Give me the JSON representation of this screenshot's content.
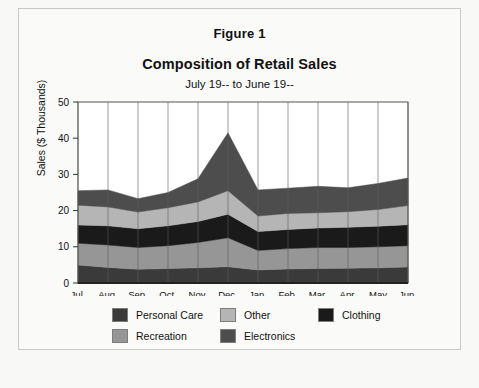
{
  "figure": {
    "label": "Figure 1",
    "title": "Composition of Retail Sales",
    "subtitle": "July 19-- to June 19--"
  },
  "chart_data": {
    "type": "area",
    "stacked": true,
    "title": "Composition of Retail Sales",
    "subtitle": "July 19-- to June 19--",
    "xlabel": "",
    "ylabel": "Sales ($ Thousands)",
    "ylim": [
      0,
      50
    ],
    "yticks": [
      0,
      10,
      20,
      30,
      40,
      50
    ],
    "grid": "vertical",
    "legend_position": "bottom",
    "categories": [
      "Jul.",
      "Aug.",
      "Sep.",
      "Oct.",
      "Nov.",
      "Dec.",
      "Jan.",
      "Feb.",
      "Mar.",
      "Apr.",
      "May",
      "Jun."
    ],
    "series": [
      {
        "name": "Personal Care",
        "color": "#3a3a3a",
        "values": [
          5.0,
          4.3,
          3.8,
          4.0,
          4.2,
          4.5,
          3.6,
          3.9,
          4.0,
          4.1,
          4.2,
          4.4
        ]
      },
      {
        "name": "Recreation",
        "color": "#969696",
        "values": [
          6.0,
          6.2,
          6.0,
          6.3,
          7.0,
          8.0,
          5.4,
          5.6,
          5.8,
          5.7,
          5.8,
          5.9
        ]
      },
      {
        "name": "Clothing",
        "color": "#1a1a1a",
        "values": [
          5.0,
          5.3,
          5.2,
          5.5,
          5.8,
          6.5,
          5.2,
          5.3,
          5.4,
          5.6,
          5.7,
          5.8
        ]
      },
      {
        "name": "Other",
        "color": "#b5b5b5",
        "values": [
          5.5,
          5.2,
          4.6,
          5.0,
          5.4,
          6.5,
          4.3,
          4.4,
          4.2,
          4.3,
          4.6,
          5.3
        ]
      },
      {
        "name": "Electronics",
        "color": "#4d4d4d",
        "values": [
          4.0,
          4.7,
          3.7,
          4.2,
          6.4,
          16.0,
          7.2,
          7.0,
          7.3,
          6.6,
          7.2,
          7.6
        ]
      }
    ],
    "totals": [
      25.5,
      25.7,
      23.3,
      25.0,
      28.8,
      41.5,
      25.7,
      26.2,
      26.7,
      26.3,
      27.5,
      29.0
    ]
  },
  "legend": {
    "row1": [
      {
        "label": "Personal Care",
        "color": "#3a3a3a"
      },
      {
        "label": "Other",
        "color": "#b5b5b5"
      },
      {
        "label": "Clothing",
        "color": "#1a1a1a"
      }
    ],
    "row2": [
      {
        "label": "Recreation",
        "color": "#969696"
      },
      {
        "label": "Electronics",
        "color": "#4d4d4d"
      }
    ]
  }
}
